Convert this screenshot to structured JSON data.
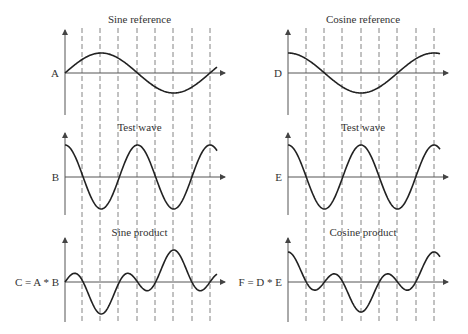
{
  "panels": [
    {
      "id": "sine-reference",
      "title": "Sine reference",
      "label": "A",
      "col": 0,
      "row": 0
    },
    {
      "id": "cosine-reference",
      "title": "Cosine reference",
      "label": "D",
      "col": 1,
      "row": 0
    },
    {
      "id": "test-wave-left",
      "title": "Test wave",
      "label": "B",
      "col": 0,
      "row": 1
    },
    {
      "id": "test-wave-right",
      "title": "Test wave",
      "label": "E",
      "col": 1,
      "row": 1
    },
    {
      "id": "sine-product",
      "title": "Sine product",
      "label": "C = A * B",
      "col": 0,
      "row": 2
    },
    {
      "id": "cosine-product",
      "title": "Cosine product",
      "label": "F = D * E",
      "col": 1,
      "row": 2
    }
  ],
  "layout": {
    "columns": [
      {
        "axis_x": 65,
        "end_x": 225,
        "dashes": [
          82,
          100,
          118,
          137,
          155,
          173,
          192,
          210
        ]
      },
      {
        "axis_x": 288,
        "end_x": 448,
        "dashes": [
          306,
          324,
          342,
          361,
          379,
          397,
          416,
          434
        ]
      }
    ],
    "rows": [
      {
        "axis_y": 73,
        "top": 30,
        "bottom": 115,
        "title_y": 23
      },
      {
        "axis_y": 177,
        "top": 133,
        "bottom": 215,
        "title_y": 131
      },
      {
        "axis_y": 282,
        "top": 238,
        "bottom": 322,
        "title_y": 236
      }
    ],
    "line_color": "#222222",
    "axis_color": "#555555",
    "dash_color": "#666666"
  }
}
